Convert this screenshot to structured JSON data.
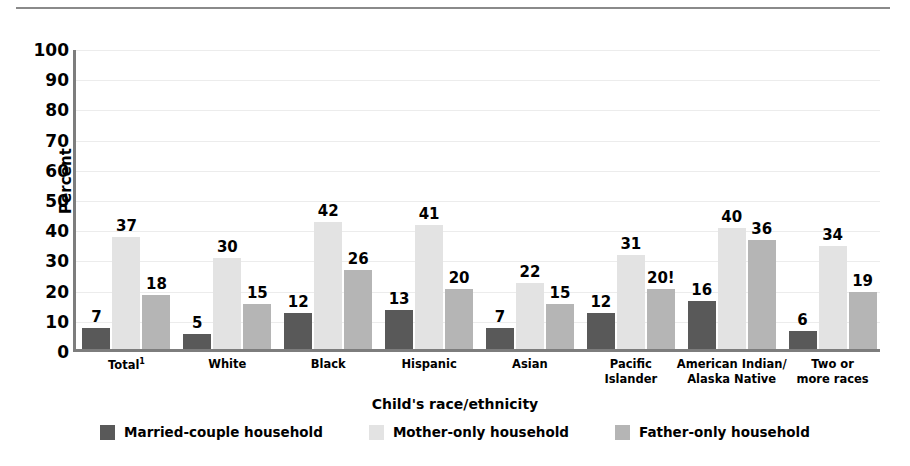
{
  "chart_data": {
    "type": "bar",
    "title": "",
    "subtitle": "",
    "xlabel": "Child's race/ethnicity",
    "ylabel": "Percent",
    "ylim": [
      0,
      100
    ],
    "ytick_step": 10,
    "yticks": [
      0,
      10,
      20,
      30,
      40,
      50,
      60,
      70,
      80,
      90,
      100
    ],
    "grid": true,
    "grid_axis": "y",
    "legend_position": "bottom",
    "categories": [
      "Total¹",
      "White",
      "Black",
      "Hispanic",
      "Asian",
      "Pacific\nIslander",
      "American Indian/\nAlaska Native",
      "Two or\nmore races"
    ],
    "series": [
      {
        "name": "Married-couple household",
        "color": "#595959",
        "values": [
          7,
          5,
          12,
          13,
          7,
          12,
          16,
          6
        ],
        "labels": [
          "7",
          "5",
          "12",
          "13",
          "7",
          "12",
          "16",
          "6"
        ]
      },
      {
        "name": "Mother-only household",
        "color": "#e3e3e3",
        "values": [
          37,
          30,
          42,
          41,
          22,
          31,
          40,
          34
        ],
        "labels": [
          "37",
          "30",
          "42",
          "41",
          "22",
          "31",
          "40",
          "34"
        ]
      },
      {
        "name": "Father-only household",
        "color": "#b5b5b5",
        "values": [
          18,
          15,
          26,
          20,
          15,
          20,
          36,
          19
        ],
        "labels": [
          "18",
          "15",
          "26",
          "20",
          "15",
          "20!",
          "36",
          "19"
        ]
      }
    ],
    "annotations": [
      "! Interpret data with caution (Pacific Islander, Father-only household = 20!)"
    ]
  },
  "colors": {
    "series_married": "#595959",
    "series_mother": "#e3e3e3",
    "series_father": "#b5b5b5",
    "axis": "#7d7d7d",
    "gridline": "#ececec",
    "rule": "#8a8a8a",
    "text": "#000000"
  }
}
